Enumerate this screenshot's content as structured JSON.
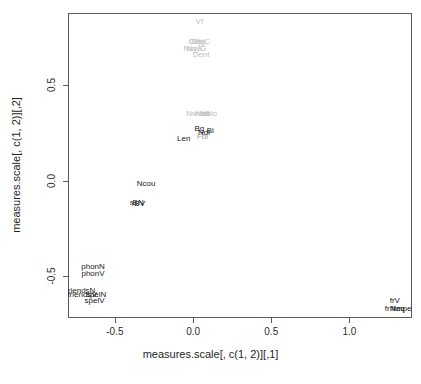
{
  "chart_data": {
    "type": "scatter",
    "title": "",
    "xlabel": "measures.scale[, c(1, 2)][,1]",
    "ylabel": "measures.scale[, c(1, 2)][,2]",
    "xlim": [
      -0.8,
      1.4
    ],
    "ylim": [
      -0.72,
      0.88
    ],
    "xticks": [
      -0.5,
      0.0,
      0.5,
      1.0
    ],
    "xticklabels": [
      "-0.5",
      "0.0",
      "0.5",
      "1.0"
    ],
    "yticks": [
      -0.5,
      0.0,
      0.5
    ],
    "yticklabels": [
      "-0.5",
      "0.0",
      "0.5"
    ],
    "grid": false,
    "legend": false,
    "marker": "text-label",
    "points": [
      {
        "label": "Vf",
        "x": 0.04,
        "y": 0.84,
        "color": "#c2c2c2"
      },
      {
        "label": "ObjC",
        "x": 0.05,
        "y": 0.735,
        "color": "#c2c2c2"
      },
      {
        "label": "Obj",
        "x": 0.01,
        "y": 0.735,
        "color": "#c2c2c2"
      },
      {
        "label": "Cmp",
        "x": 0.03,
        "y": 0.735,
        "color": "#c2c2c2"
      },
      {
        "label": "NsyS",
        "x": 0.0,
        "y": 0.695,
        "color": "#c2c2c2"
      },
      {
        "label": "NsyG",
        "x": 0.02,
        "y": 0.695,
        "color": "#c2c2c2"
      },
      {
        "label": "Dent",
        "x": 0.05,
        "y": 0.665,
        "color": "#c2c2c2"
      },
      {
        "label": "Nword",
        "x": 0.03,
        "y": 0.355,
        "color": "#bdbdbd"
      },
      {
        "label": "Nlet",
        "x": 0.06,
        "y": 0.355,
        "color": "#bdbdbd"
      },
      {
        "label": "Nbio",
        "x": 0.1,
        "y": 0.355,
        "color": "#bdbdbd"
      },
      {
        "label": "Bg",
        "x": 0.04,
        "y": 0.275,
        "color": "#1a1a1a"
      },
      {
        "label": "Bi",
        "x": 0.11,
        "y": 0.265,
        "color": "#1a1a1a"
      },
      {
        "label": "Ndi",
        "x": 0.07,
        "y": 0.255,
        "color": "#1a1a1a"
      },
      {
        "label": "Fbi",
        "x": 0.06,
        "y": 0.235,
        "color": "#9a9a9a"
      },
      {
        "label": "Len",
        "x": -0.06,
        "y": 0.225,
        "color": "#1a1a1a"
      },
      {
        "label": "Ncou",
        "x": -0.3,
        "y": -0.01,
        "color": "#1a1a1a"
      },
      {
        "label": "rBN",
        "x": -0.36,
        "y": -0.11,
        "color": "#1a1a1a"
      },
      {
        "label": "rBV",
        "x": -0.35,
        "y": -0.115,
        "color": "#1a1a1a"
      },
      {
        "label": "phonN",
        "x": -0.64,
        "y": -0.445,
        "color": "#1a1a1a"
      },
      {
        "label": "phonV",
        "x": -0.64,
        "y": -0.485,
        "color": "#1a1a1a"
      },
      {
        "label": "friendsN",
        "x": -0.72,
        "y": -0.575,
        "color": "#1a1a1a"
      },
      {
        "label": "friendsV",
        "x": -0.71,
        "y": -0.595,
        "color": "#1a1a1a"
      },
      {
        "label": "spelN",
        "x": -0.62,
        "y": -0.595,
        "color": "#1a1a1a"
      },
      {
        "label": "spelV",
        "x": -0.63,
        "y": -0.625,
        "color": "#1a1a1a"
      },
      {
        "label": "frV",
        "x": 1.29,
        "y": -0.625,
        "color": "#1a1a1a"
      },
      {
        "label": "frN",
        "x": 1.26,
        "y": -0.665,
        "color": "#1a1a1a"
      },
      {
        "label": "freq",
        "x": 1.31,
        "y": -0.665,
        "color": "#1a1a1a"
      },
      {
        "label": "imper",
        "x": 1.35,
        "y": -0.665,
        "color": "#1a1a1a"
      }
    ]
  },
  "axes": {
    "x": {
      "title": "measures.scale[, c(1, 2)][,1]",
      "ticks": [
        {
          "label": "-0.5",
          "value": -0.5
        },
        {
          "label": "0.0",
          "value": 0.0
        },
        {
          "label": "0.5",
          "value": 0.5
        },
        {
          "label": "1.0",
          "value": 1.0
        }
      ]
    },
    "y": {
      "title": "measures.scale[, c(1, 2)][,2]",
      "ticks": [
        {
          "label": "-0.5",
          "value": -0.5
        },
        {
          "label": "0.0",
          "value": 0.0
        },
        {
          "label": "0.5",
          "value": 0.5
        }
      ]
    }
  },
  "style": {
    "box_color": "#5a5a5a",
    "background": "#ffffff",
    "label_dark": "#1a1a1a",
    "label_light": "#c2c2c2"
  }
}
